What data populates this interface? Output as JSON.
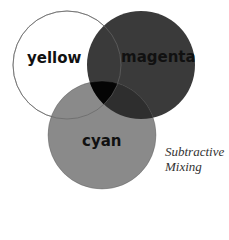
{
  "diagram": {
    "type": "venn",
    "title": "Subtractive Mixing",
    "caption_lines": [
      "Subtractive",
      "Mixing"
    ],
    "circles": [
      {
        "id": "yellow",
        "label": "yellow",
        "cx": 67,
        "cy": 65,
        "r": 54,
        "fill": "#ffffff",
        "stroke": "#888888"
      },
      {
        "id": "magenta",
        "label": "magenta",
        "cx": 141,
        "cy": 65,
        "r": 54,
        "fill": "#3a3a3a",
        "stroke": "#2a2a2a"
      },
      {
        "id": "cyan",
        "label": "cyan",
        "cx": 102,
        "cy": 135,
        "r": 54,
        "fill": "#8a8a8a",
        "stroke": "#777777"
      }
    ],
    "overlaps": {
      "yellow_magenta": "#383838",
      "yellow_cyan": "#8a8a8a",
      "magenta_cyan": "#2e2e2e",
      "all_three": "#050505"
    }
  }
}
